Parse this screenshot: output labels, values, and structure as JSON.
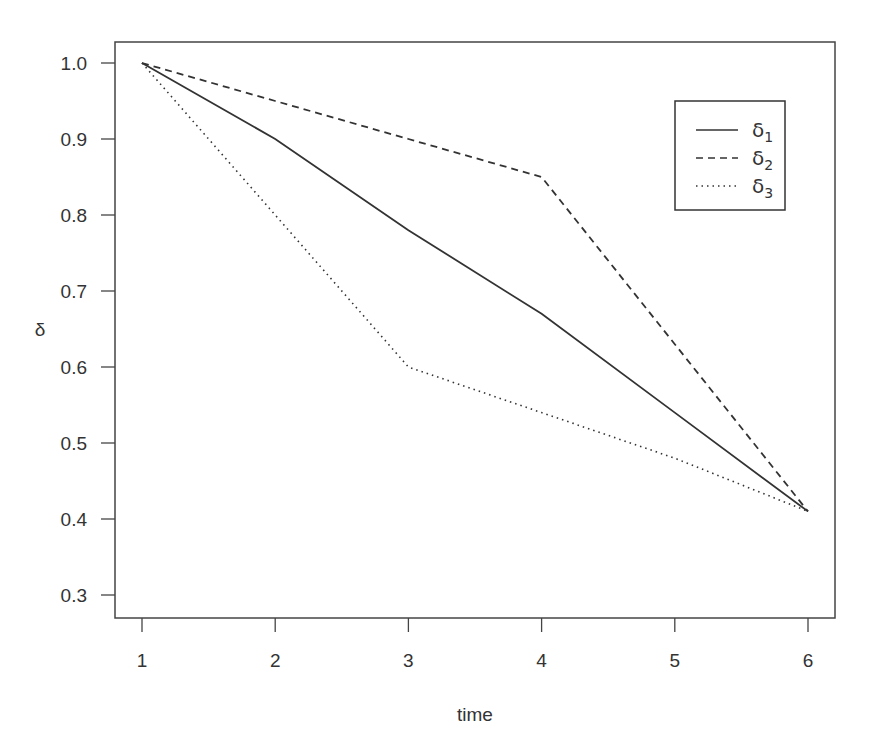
{
  "chart_data": {
    "type": "line",
    "title": "",
    "xlabel": "time",
    "ylabel": "δ",
    "x": [
      1,
      2,
      3,
      4,
      5,
      6
    ],
    "xlim": [
      0.8,
      6.2
    ],
    "ylim": [
      0.27,
      1.05
    ],
    "xticks": [
      1,
      2,
      3,
      4,
      5,
      6
    ],
    "yticks": [
      0.3,
      0.4,
      0.5,
      0.6,
      0.7,
      0.8,
      0.9,
      1.0
    ],
    "ytick_labels": [
      "0.3",
      "0.4",
      "0.5",
      "0.6",
      "0.7",
      "0.8",
      "0.9",
      "1.0"
    ],
    "grid": false,
    "legend_position": "top-right",
    "series": [
      {
        "name": "δ1",
        "base": "δ",
        "sub": "1",
        "style": "solid",
        "values": [
          1.0,
          0.9,
          0.78,
          0.67,
          0.54,
          0.41
        ]
      },
      {
        "name": "δ2",
        "base": "δ",
        "sub": "2",
        "style": "dashed",
        "values": [
          1.0,
          0.95,
          0.9,
          0.85,
          0.63,
          0.41
        ]
      },
      {
        "name": "δ3",
        "base": "δ",
        "sub": "3",
        "style": "dotted",
        "values": [
          1.0,
          0.8,
          0.6,
          0.54,
          0.48,
          0.41
        ]
      }
    ],
    "line_color": "#333333"
  }
}
